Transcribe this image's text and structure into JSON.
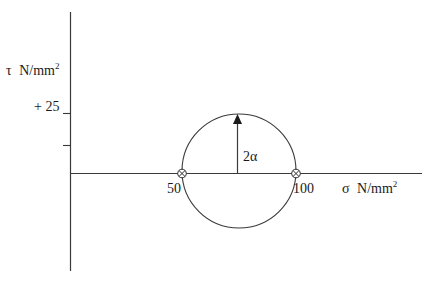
{
  "diagram": {
    "type": "mohr-circle",
    "y_axis": {
      "symbol": "τ",
      "unit": "N/mm",
      "unit_sup": "2",
      "tick_label": "+ 25"
    },
    "x_axis": {
      "symbol": "σ",
      "unit": "N/mm",
      "unit_sup": "2"
    },
    "points": [
      {
        "label": "50",
        "marker": "circle-x"
      },
      {
        "label": "100",
        "marker": "circle-x"
      }
    ],
    "radius_label": "2α",
    "colors": {
      "line": "#3a3a3a",
      "text": "#1a1a1a"
    }
  }
}
